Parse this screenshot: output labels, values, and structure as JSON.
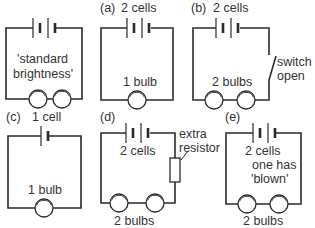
{
  "diagram": {
    "type": "circuit-comparison",
    "stroke_color": "#2a2a2a",
    "text_color": "#333333",
    "circuits": [
      {
        "id": "standard",
        "tag": "",
        "cells_label": "",
        "cells": 2,
        "bulbs": 2,
        "note_lines": [
          "'standard",
          "brightness'"
        ],
        "bulbs_label": ""
      },
      {
        "id": "a",
        "tag": "(a)",
        "cells_label": "2 cells",
        "cells": 2,
        "bulbs": 1,
        "bulbs_label": "1 bulb"
      },
      {
        "id": "b",
        "tag": "(b)",
        "cells_label": "2 cells",
        "cells": 2,
        "bulbs": 2,
        "bulbs_label": "2 bulbs",
        "switch_label_lines": [
          "switch",
          "open"
        ]
      },
      {
        "id": "c",
        "tag": "(c)",
        "cells_label": "1 cell",
        "cells": 1,
        "bulbs": 1,
        "bulbs_label": "1 bulb"
      },
      {
        "id": "d",
        "tag": "(d)",
        "cells_label": "2 cells",
        "cells": 2,
        "bulbs": 2,
        "bulbs_label": "2 bulbs",
        "resistor_label_lines": [
          "extra",
          "resistor"
        ]
      },
      {
        "id": "e",
        "tag": "(e)",
        "cells_label": "2 cells",
        "cells": 2,
        "bulbs": 2,
        "note_lines": [
          "one has",
          "'blown'"
        ],
        "bulbs_label": "2 bulbs"
      }
    ]
  }
}
